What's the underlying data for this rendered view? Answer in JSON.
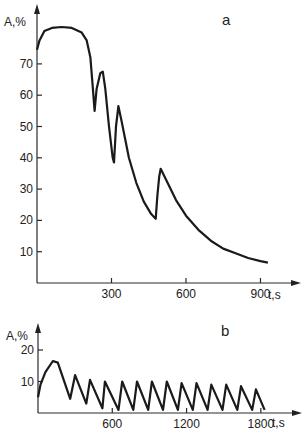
{
  "chart_data": [
    {
      "panel": "a",
      "type": "line",
      "title": "",
      "xlabel": "t, s",
      "ylabel": "A, %",
      "xlim": [
        0,
        950
      ],
      "ylim": [
        0,
        85
      ],
      "x_ticks": [
        300,
        600,
        900
      ],
      "y_ticks": [
        10,
        20,
        30,
        40,
        50,
        60,
        70
      ],
      "grid": false,
      "series": [
        {
          "name": "A",
          "x": [
            0,
            10,
            30,
            60,
            100,
            140,
            180,
            200,
            215,
            225,
            232,
            240,
            255,
            265,
            275,
            290,
            305,
            310,
            318,
            328,
            340,
            370,
            400,
            430,
            460,
            478,
            485,
            492,
            498,
            520,
            560,
            600,
            650,
            700,
            750,
            800,
            850,
            900,
            930
          ],
          "values": [
            74.5,
            77.5,
            80.5,
            81.5,
            81.8,
            81.5,
            80,
            77.5,
            72,
            62,
            55,
            62,
            67,
            67.5,
            62,
            50,
            40,
            38.5,
            50,
            56.5,
            52,
            40,
            32,
            26,
            22,
            20.5,
            28,
            34,
            36.5,
            33,
            26.5,
            21.5,
            17,
            13.5,
            11,
            9.5,
            8,
            7,
            6.5
          ]
        }
      ]
    },
    {
      "panel": "b",
      "type": "line",
      "title": "",
      "xlabel": "t, s",
      "ylabel": "A, %",
      "xlim": [
        0,
        1900
      ],
      "ylim": [
        0,
        22
      ],
      "x_ticks": [
        600,
        1200,
        1800
      ],
      "y_ticks": [
        10,
        20
      ],
      "grid": false,
      "series": [
        {
          "name": "A",
          "x": [
            0,
            20,
            60,
            120,
            160,
            260,
            300,
            390,
            420,
            520,
            540,
            650,
            680,
            770,
            800,
            890,
            920,
            1010,
            1040,
            1130,
            1160,
            1250,
            1280,
            1370,
            1400,
            1490,
            1520,
            1610,
            1640,
            1730,
            1760,
            1830
          ],
          "values": [
            5,
            9,
            13,
            16.5,
            16,
            4.5,
            12,
            3,
            10.5,
            1.5,
            10,
            1,
            10,
            1,
            10,
            1,
            10,
            1,
            10,
            1,
            9.5,
            1,
            9.5,
            1,
            9,
            1,
            9,
            1,
            8.5,
            1,
            7.5,
            1
          ]
        }
      ]
    }
  ],
  "panels": {
    "a": {
      "label": "a",
      "y_axis_label": "A,%",
      "x_axis_label": "t,s",
      "x_tick_labels": [
        "300",
        "600",
        "900"
      ],
      "y_tick_labels": [
        "70",
        "60",
        "50",
        "40",
        "30",
        "20",
        "10"
      ]
    },
    "b": {
      "label": "b",
      "y_axis_label": "A,%",
      "x_axis_label": "t,s",
      "x_tick_labels": [
        "600",
        "1200",
        "1800"
      ],
      "y_tick_labels": [
        "20",
        "10"
      ]
    }
  }
}
